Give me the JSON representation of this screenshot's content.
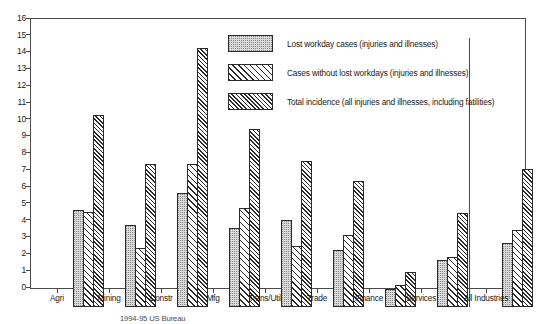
{
  "chart_data": {
    "type": "bar",
    "title": "",
    "xlabel": "",
    "ylabel": "",
    "ylim": [
      0,
      16
    ],
    "ytick_step": 1,
    "grid": false,
    "legend_position": "inside-top-right",
    "yticks": [
      "0",
      "1",
      "2",
      "3",
      "4",
      "5",
      "6",
      "7",
      "8",
      "9",
      "10",
      "11",
      "12",
      "13",
      "14",
      "15",
      "16"
    ],
    "categories": [
      "Agri",
      "Mining",
      "Constr",
      "Mfg",
      "Trans/Util",
      "Trade",
      "Finance",
      "Services",
      "All Industries"
    ],
    "series": [
      {
        "name": "Lost workday cases (injuries and illnesses)",
        "pattern": "stipple-gray",
        "values": [
          5.8,
          4.9,
          6.8,
          4.7,
          5.2,
          3.4,
          1.1,
          2.8,
          3.8
        ]
      },
      {
        "name": "Cases without lost workdays (injuries and illnesses)",
        "pattern": "diagonal-hatch-wide",
        "values": [
          5.65,
          3.5,
          8.5,
          5.9,
          3.6,
          4.3,
          1.3,
          3.0,
          4.6
        ]
      },
      {
        "name": "Total incidence (all injuries and illnesses, including fatilities)",
        "pattern": "diagonal-hatch-dense",
        "values": [
          11.4,
          8.5,
          15.4,
          10.6,
          8.7,
          7.5,
          2.1,
          5.6,
          8.2
        ]
      }
    ],
    "separator_after_category": "Services"
  },
  "caption": {
    "text": "1994-95 US Bureau"
  },
  "colors": {
    "axis": "#4a4a4a",
    "bar_outline": "#2a2a2a",
    "series_1_fill": "#d9d9d9",
    "text": "#1a1a1a"
  }
}
